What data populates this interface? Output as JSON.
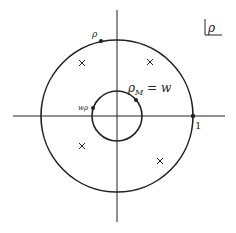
{
  "diagram": {
    "corner_label": "ρ",
    "axes": {
      "origin": [
        117,
        116
      ],
      "horizontal": {
        "x1": 13,
        "x2": 225
      },
      "vertical": {
        "y1": 10,
        "y2": 222
      }
    },
    "outer_circle": {
      "radius": 76
    },
    "inner_circle": {
      "radius": 25
    },
    "points": [
      {
        "id": "rho",
        "label": "ρ",
        "x": 101,
        "y": 41,
        "label_x": 92,
        "label_y": 37
      },
      {
        "id": "w-rho",
        "label": "wρ",
        "x": 93,
        "y": 108,
        "label_x": 78,
        "label_y": 110
      },
      {
        "id": "rho-m",
        "label": "ρ_M = w",
        "x": 136,
        "y": 100,
        "label_x": 128,
        "label_y": 92
      },
      {
        "id": "one",
        "label": "1",
        "x": 193,
        "y": 116,
        "label_x": 195,
        "label_y": 129
      }
    ],
    "crosses": [
      {
        "x": 82,
        "y": 63
      },
      {
        "x": 150,
        "y": 62
      },
      {
        "x": 82,
        "y": 146
      },
      {
        "x": 160,
        "y": 161
      }
    ],
    "colors": {
      "stroke": "#222222",
      "background": "#ffffff"
    }
  }
}
